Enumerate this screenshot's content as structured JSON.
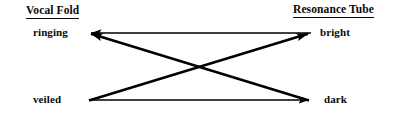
{
  "figure": {
    "type": "relationship-diagram",
    "background_color": "#ffffff",
    "line_color": "#000000",
    "text_color": "#0a0a0a"
  },
  "columns": {
    "left": {
      "heading": "Vocal Fold",
      "heading_underlined": true,
      "states": [
        {
          "id": "ringing",
          "label": "ringing",
          "row": "top"
        },
        {
          "id": "veiled",
          "label": "veiled",
          "row": "bottom"
        }
      ]
    },
    "right": {
      "heading": "Resonance Tube",
      "heading_underlined": true,
      "states": [
        {
          "id": "bright",
          "label": "bright",
          "row": "top"
        },
        {
          "id": "dark",
          "label": "dark",
          "row": "bottom"
        }
      ]
    }
  },
  "arrows": [
    {
      "id": "bright-to-ringing",
      "kind": "horizontal",
      "from": "bright",
      "to": "ringing",
      "direction": "leftward",
      "x1": 310,
      "y1": 33,
      "x2": 90,
      "y2": 33,
      "head_at": "end"
    },
    {
      "id": "veiled-to-dark",
      "kind": "horizontal",
      "from": "veiled",
      "to": "dark",
      "direction": "rightward",
      "x1": 90,
      "y1": 100,
      "x2": 310,
      "y2": 100,
      "head_at": "end"
    },
    {
      "id": "veiled-to-bright",
      "kind": "diagonal",
      "from": "veiled",
      "to": "bright",
      "direction": "up-right",
      "x1": 90,
      "y1": 100,
      "x2": 310,
      "y2": 33,
      "head_at": "end"
    },
    {
      "id": "bright-side-to-ringing-cross",
      "kind": "diagonal",
      "from": "dark",
      "to": "ringing",
      "direction": "up-left",
      "x1": 310,
      "y1": 100,
      "x2": 90,
      "y2": 33,
      "head_at": "end"
    }
  ],
  "geometry": {
    "top_row_y": 33,
    "bottom_row_y": 100,
    "left_node_x": 90,
    "right_node_x": 310,
    "crossing_point_x": 199,
    "crossing_point_y": 67,
    "stroke_width_horizontal": 1.6,
    "stroke_width_diagonal": 2.6
  },
  "icons": {
    "arrowhead": "triangle-arrowhead-icon"
  }
}
